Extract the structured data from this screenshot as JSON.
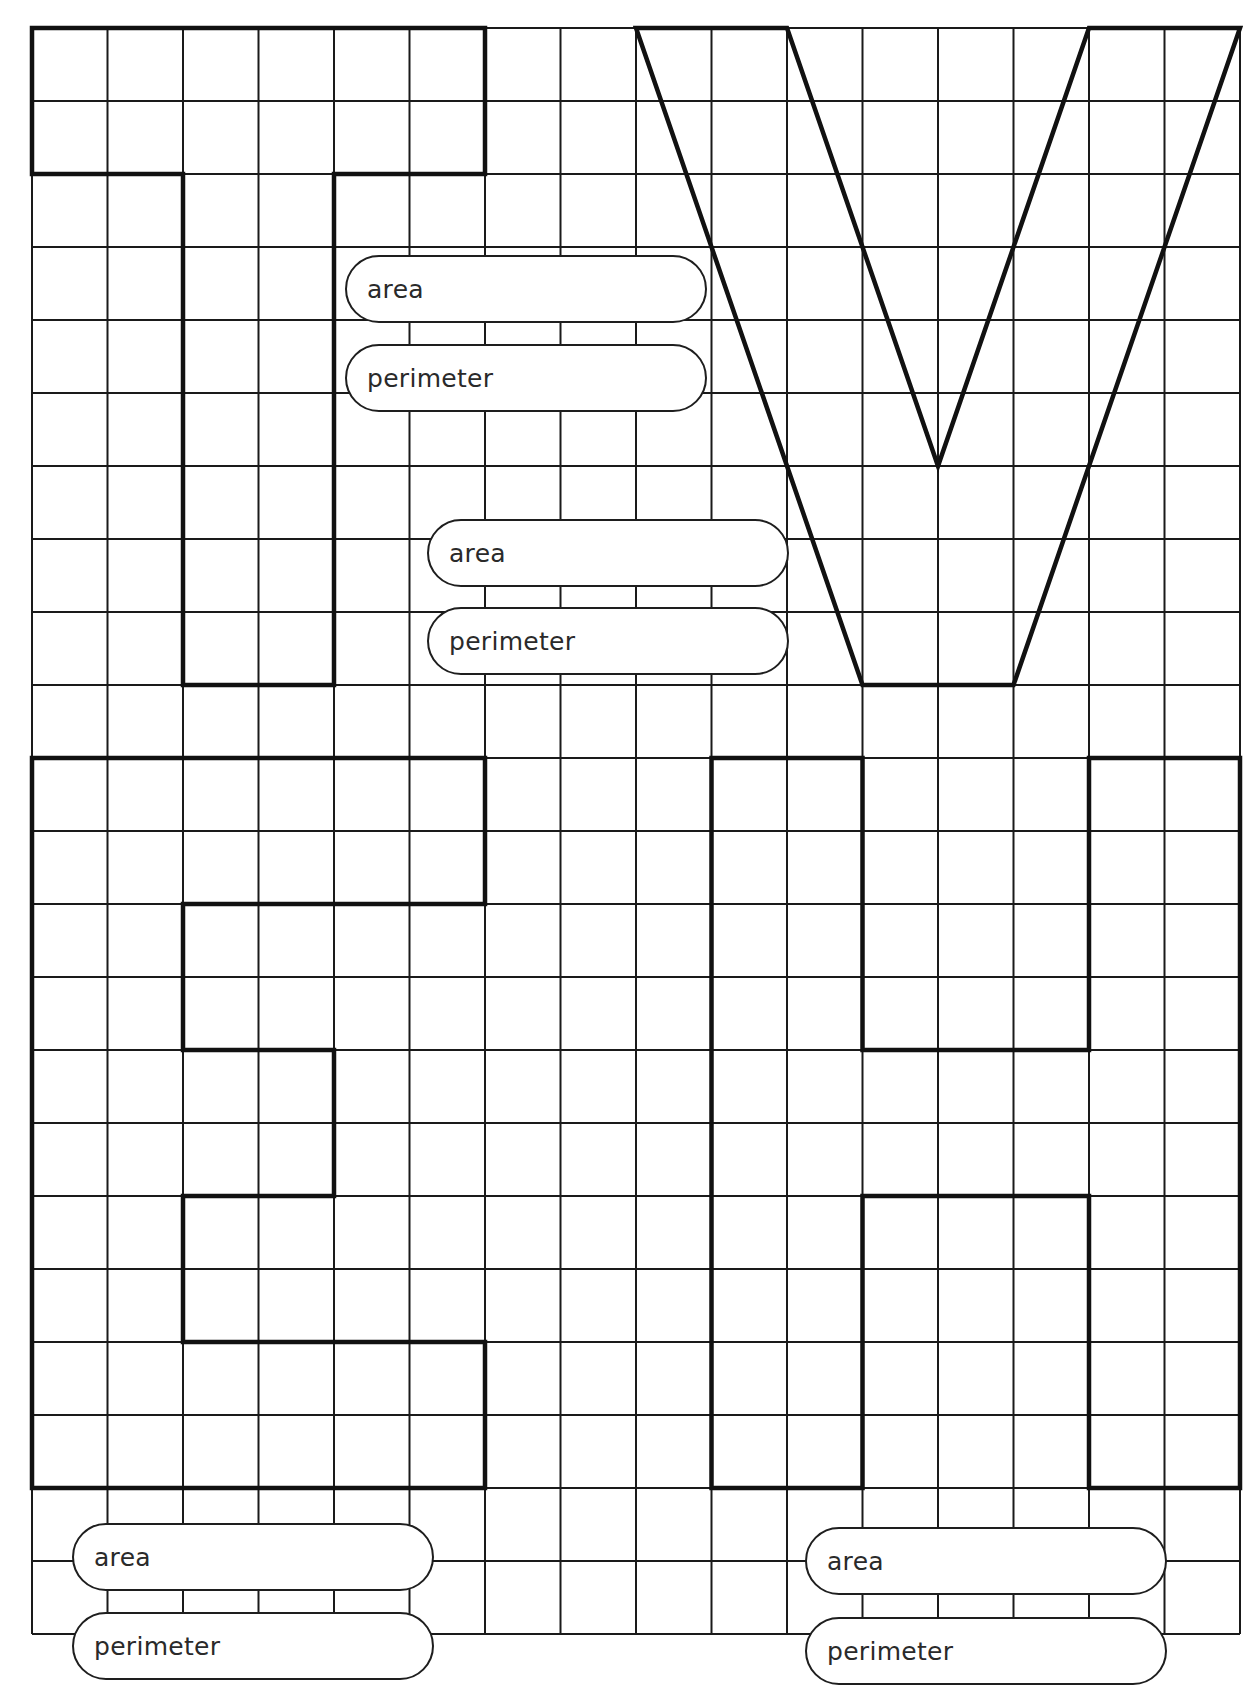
{
  "worksheet": {
    "grid": {
      "columns": 16,
      "rows": 22,
      "origin_x": 32,
      "origin_y": 28,
      "cell_width": 75.5,
      "cell_height": 73,
      "line_color": "#1a1a1a",
      "outline_color": "#111111"
    },
    "shapes": [
      {
        "letter": "T",
        "points": [
          [
            0,
            0
          ],
          [
            6,
            0
          ],
          [
            6,
            2
          ],
          [
            4,
            2
          ],
          [
            4,
            9
          ],
          [
            2,
            9
          ],
          [
            2,
            2
          ],
          [
            0,
            2
          ]
        ]
      },
      {
        "letter": "V",
        "points": [
          [
            8,
            0
          ],
          [
            10,
            0
          ],
          [
            12,
            6
          ],
          [
            14,
            0
          ],
          [
            16,
            0
          ],
          [
            13,
            9
          ],
          [
            11,
            9
          ]
        ]
      },
      {
        "letter": "E",
        "points": [
          [
            0,
            10
          ],
          [
            6,
            10
          ],
          [
            6,
            12
          ],
          [
            2,
            12
          ],
          [
            2,
            14
          ],
          [
            4,
            14
          ],
          [
            4,
            16
          ],
          [
            2,
            16
          ],
          [
            2,
            18
          ],
          [
            6,
            18
          ],
          [
            6,
            20
          ],
          [
            0,
            20
          ]
        ]
      },
      {
        "letter": "H",
        "points": [
          [
            9,
            10
          ],
          [
            11,
            10
          ],
          [
            11,
            14
          ],
          [
            14,
            14
          ],
          [
            14,
            10
          ],
          [
            16,
            10
          ],
          [
            16,
            20
          ],
          [
            14,
            20
          ],
          [
            14,
            16
          ],
          [
            11,
            16
          ],
          [
            11,
            20
          ],
          [
            9,
            20
          ]
        ]
      }
    ],
    "answer_boxes": [
      {
        "shape": "T",
        "label": "area"
      },
      {
        "shape": "T",
        "label": "perimeter"
      },
      {
        "shape": "V",
        "label": "area"
      },
      {
        "shape": "V",
        "label": "perimeter"
      },
      {
        "shape": "E",
        "label": "area"
      },
      {
        "shape": "E",
        "label": "perimeter"
      },
      {
        "shape": "H",
        "label": "area"
      },
      {
        "shape": "H",
        "label": "perimeter"
      }
    ]
  }
}
